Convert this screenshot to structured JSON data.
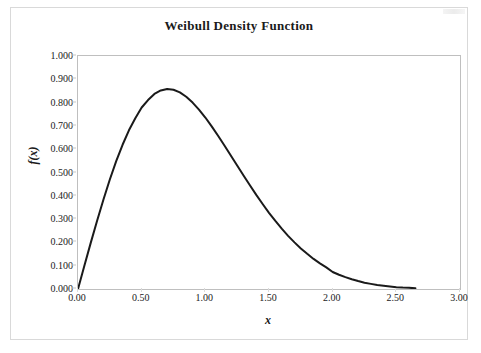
{
  "chart_data": {
    "type": "line",
    "title": "Weibull Density Function",
    "xlabel": "x",
    "ylabel": "f(x)",
    "xlim": [
      0.0,
      3.0
    ],
    "ylim": [
      0.0,
      1.0
    ],
    "grid": false,
    "legend": null,
    "x_ticks": [
      "0.00",
      "0.50",
      "1.00",
      "1.50",
      "2.00",
      "2.50",
      "3.00"
    ],
    "x_tick_values": [
      0.0,
      0.5,
      1.0,
      1.5,
      2.0,
      2.5,
      3.0
    ],
    "y_ticks": [
      "0.000",
      "0.100",
      "0.200",
      "0.300",
      "0.400",
      "0.500",
      "0.600",
      "0.700",
      "0.800",
      "0.900",
      "1.000"
    ],
    "y_tick_values": [
      0.0,
      0.1,
      0.2,
      0.3,
      0.4,
      0.5,
      0.6,
      0.7,
      0.8,
      0.9,
      1.0
    ],
    "series": [
      {
        "name": "Weibull density",
        "color": "#1a1a1a",
        "line_width": 2,
        "x": [
          0.0,
          0.05,
          0.1,
          0.15,
          0.2,
          0.25,
          0.3,
          0.35,
          0.4,
          0.45,
          0.5,
          0.55,
          0.6,
          0.65,
          0.7,
          0.75,
          0.8,
          0.85,
          0.9,
          0.95,
          1.0,
          1.05,
          1.1,
          1.15,
          1.2,
          1.25,
          1.3,
          1.35,
          1.4,
          1.45,
          1.5,
          1.55,
          1.6,
          1.65,
          1.7,
          1.75,
          1.8,
          1.85,
          1.9,
          1.95,
          2.0,
          2.05,
          2.1,
          2.15,
          2.2,
          2.25,
          2.3,
          2.35,
          2.4,
          2.45,
          2.5,
          2.55,
          2.6,
          2.65
        ],
        "values": [
          0.0,
          0.1,
          0.198,
          0.293,
          0.384,
          0.47,
          0.549,
          0.619,
          0.681,
          0.733,
          0.779,
          0.811,
          0.837,
          0.852,
          0.858,
          0.855,
          0.844,
          0.825,
          0.8,
          0.77,
          0.736,
          0.698,
          0.658,
          0.616,
          0.573,
          0.53,
          0.487,
          0.445,
          0.404,
          0.365,
          0.327,
          0.292,
          0.259,
          0.228,
          0.2,
          0.174,
          0.151,
          0.129,
          0.11,
          0.093,
          0.073,
          0.061,
          0.051,
          0.042,
          0.034,
          0.027,
          0.022,
          0.017,
          0.014,
          0.011,
          0.008,
          0.006,
          0.005,
          0.003
        ]
      }
    ]
  }
}
